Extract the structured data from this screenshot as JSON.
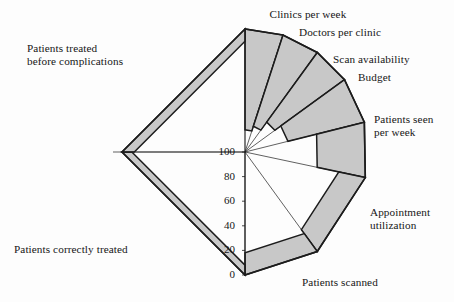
{
  "figure": {
    "type": "radar-deficit-chart",
    "background_color": "#fdfdfd",
    "fill_color": "#c8c8c8",
    "line_color": "#1c1c1c",
    "center": {
      "x": 245,
      "y": 152
    },
    "radius": 123
  },
  "axis": {
    "tick_labels": [
      "100",
      "80",
      "60",
      "40",
      "20",
      "0"
    ],
    "tick_values": [
      100,
      80,
      60,
      40,
      20,
      0
    ],
    "direction": "center-is-100-edge-is-0"
  },
  "labels": {
    "clinics_per_week": "Clinics per week",
    "doctors_per_clinic": "Doctors per clinic",
    "scan_availability": "Scan availability",
    "budget": "Budget",
    "patients_seen_per_week": "Patients seen\nper week",
    "appointment_utilization": "Appointment\nutilization",
    "patients_scanned": "Patients scanned",
    "patients_correctly_treated": "Patients correctly treated",
    "patients_treated_before_complications": "Patients treated\nbefore complications"
  },
  "chart_data": {
    "type": "radar",
    "title": "",
    "subtitle": "",
    "xlabel": "",
    "ylabel": "",
    "ylim": [
      0,
      100
    ],
    "scale_note": "Centre of the diagram is 100; the outer perimeter is 0. Each sector is shaded from its value outward to the perimeter, so a large shaded wedge means a low score.",
    "grid": false,
    "legend": "none",
    "tick_labels": [
      "100",
      "80",
      "60",
      "40",
      "20",
      "0"
    ],
    "categories": [
      "Clinics per week",
      "Doctors per clinic",
      "Scan availability",
      "Budget",
      "Patients seen per week",
      "Appointment utilization",
      "Patients scanned",
      "Patients correctly treated",
      "Patients treated before complications"
    ],
    "values": [
      82,
      78,
      70,
      64,
      40,
      22,
      18,
      8,
      10
    ],
    "series": [
      {
        "name": "Score",
        "values": [
          82,
          78,
          70,
          64,
          40,
          22,
          18,
          8,
          10
        ]
      }
    ],
    "sectors": [
      {
        "label": "Clinics per week",
        "value": 82,
        "start_angle_deg": -90,
        "end_angle_deg": -72
      },
      {
        "label": "Doctors per clinic",
        "value": 78,
        "start_angle_deg": -72,
        "end_angle_deg": -54
      },
      {
        "label": "Scan availability",
        "value": 70,
        "start_angle_deg": -54,
        "end_angle_deg": -36
      },
      {
        "label": "Budget",
        "value": 64,
        "start_angle_deg": -36,
        "end_angle_deg": -14
      },
      {
        "label": "Patients seen per week",
        "value": 40,
        "start_angle_deg": -14,
        "end_angle_deg": 12
      },
      {
        "label": "Appointment utilization",
        "value": 22,
        "start_angle_deg": 12,
        "end_angle_deg": 54
      },
      {
        "label": "Patients scanned",
        "value": 18,
        "start_angle_deg": 54,
        "end_angle_deg": 90
      },
      {
        "label": "Patients correctly treated",
        "value": 8,
        "start_angle_deg": 90,
        "end_angle_deg": 180
      },
      {
        "label": "Patients treated before complications",
        "value": 10,
        "start_angle_deg": 180,
        "end_angle_deg": 270
      }
    ]
  }
}
